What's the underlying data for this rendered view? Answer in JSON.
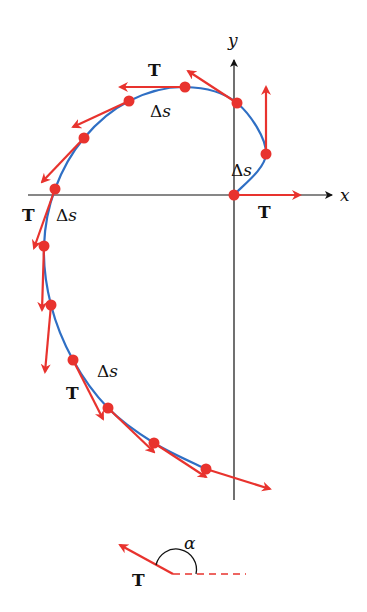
{
  "colors": {
    "curve": "#2f6fc4",
    "vector": "#e8332e",
    "axis": "#111111",
    "background": "#ffffff"
  },
  "axes": {
    "x_label": "x",
    "y_label": "y",
    "origin": [
      234,
      195
    ]
  },
  "labels": {
    "tangent": "T",
    "arc_length": "Δs",
    "angle": "α"
  },
  "curve": {
    "description": "Spiral-like curve starting at origin, turning counter-clockwise through upper-left and descending down the left side then sweeping right below the x-axis",
    "points": [
      [
        234,
        195
      ],
      [
        266,
        154
      ],
      [
        237,
        103
      ],
      [
        185,
        87
      ],
      [
        129,
        101
      ],
      [
        84,
        138
      ],
      [
        55,
        189
      ],
      [
        44,
        246
      ],
      [
        51,
        305
      ],
      [
        73,
        360
      ],
      [
        108,
        408
      ],
      [
        154,
        443
      ],
      [
        206,
        469
      ]
    ]
  },
  "tangent_vectors": [
    {
      "from": [
        234,
        195
      ],
      "to": [
        300,
        195
      ]
    },
    {
      "from": [
        266,
        154
      ],
      "to": [
        266,
        87
      ]
    },
    {
      "from": [
        237,
        103
      ],
      "to": [
        188,
        71
      ]
    },
    {
      "from": [
        185,
        87
      ],
      "to": [
        120,
        87
      ]
    },
    {
      "from": [
        129,
        101
      ],
      "to": [
        73,
        127
      ]
    },
    {
      "from": [
        84,
        138
      ],
      "to": [
        42,
        182
      ]
    },
    {
      "from": [
        55,
        189
      ],
      "to": [
        34,
        248
      ]
    },
    {
      "from": [
        44,
        246
      ],
      "to": [
        42,
        310
      ]
    },
    {
      "from": [
        51,
        305
      ],
      "to": [
        45,
        372
      ]
    },
    {
      "from": [
        73,
        360
      ],
      "to": [
        103,
        419
      ]
    },
    {
      "from": [
        108,
        408
      ],
      "to": [
        154,
        452
      ]
    },
    {
      "from": [
        154,
        443
      ],
      "to": [
        206,
        477
      ]
    },
    {
      "from": [
        206,
        469
      ],
      "to": [
        270,
        489
      ]
    }
  ],
  "annotations": [
    {
      "text": "T",
      "x": 148,
      "y": 76,
      "kind": "bold"
    },
    {
      "text": "Δs",
      "x": 150,
      "y": 117,
      "kind": "ital"
    },
    {
      "text": "Δs",
      "x": 231,
      "y": 176,
      "kind": "ital"
    },
    {
      "text": "T",
      "x": 258,
      "y": 218,
      "kind": "bold"
    },
    {
      "text": "T",
      "x": 22,
      "y": 221,
      "kind": "bold"
    },
    {
      "text": "Δs",
      "x": 56,
      "y": 221,
      "kind": "ital"
    },
    {
      "text": "Δs",
      "x": 97,
      "y": 377,
      "kind": "ital"
    },
    {
      "text": "T",
      "x": 66,
      "y": 399,
      "kind": "bold"
    }
  ],
  "angle_inset": {
    "vertex": [
      173,
      574
    ],
    "vector_to": [
      120,
      545
    ],
    "dashed_to": [
      246,
      574
    ],
    "label": "α",
    "label_pos": [
      186,
      548
    ],
    "t_label_pos": [
      132,
      584
    ]
  }
}
